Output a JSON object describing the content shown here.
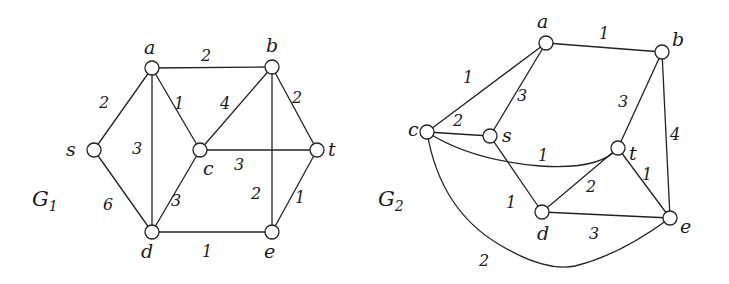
{
  "figure": {
    "graphs": [
      {
        "id": "G1",
        "title": "G",
        "subscript": "1",
        "title_pos": [
          32,
          206
        ],
        "nodes": [
          {
            "id": "a",
            "x": 152,
            "y": 68,
            "lx": 144,
            "ly": 54
          },
          {
            "id": "b",
            "x": 272,
            "y": 67,
            "lx": 266,
            "ly": 52
          },
          {
            "id": "s",
            "x": 94,
            "y": 150,
            "lx": 66,
            "ly": 156
          },
          {
            "id": "c",
            "x": 200,
            "y": 150,
            "lx": 203,
            "ly": 175
          },
          {
            "id": "t",
            "x": 317,
            "y": 150,
            "lx": 328,
            "ly": 156
          },
          {
            "id": "d",
            "x": 152,
            "y": 232,
            "lx": 141,
            "ly": 258
          },
          {
            "id": "e",
            "x": 272,
            "y": 232,
            "lx": 264,
            "ly": 258
          }
        ],
        "edges": [
          {
            "from": "a",
            "to": "b",
            "weight": "2",
            "wx": 206,
            "wy": 61
          },
          {
            "from": "s",
            "to": "a",
            "weight": "2",
            "wx": 104,
            "wy": 108
          },
          {
            "from": "a",
            "to": "c",
            "weight": "1",
            "wx": 179,
            "wy": 109
          },
          {
            "from": "a",
            "to": "d",
            "weight": "3",
            "wx": 137,
            "wy": 154
          },
          {
            "from": "c",
            "to": "b",
            "weight": "4",
            "wx": 225,
            "wy": 109
          },
          {
            "from": "b",
            "to": "t",
            "weight": "2",
            "wx": 297,
            "wy": 103
          },
          {
            "from": "b",
            "to": "e",
            "weight": "2",
            "wx": 256,
            "wy": 199
          },
          {
            "from": "c",
            "to": "t",
            "weight": "3",
            "wx": 239,
            "wy": 170
          },
          {
            "from": "s",
            "to": "d",
            "weight": "6",
            "wx": 108,
            "wy": 210
          },
          {
            "from": "c",
            "to": "d",
            "weight": "3",
            "wx": 176,
            "wy": 206
          },
          {
            "from": "t",
            "to": "e",
            "weight": "1",
            "wx": 300,
            "wy": 203
          },
          {
            "from": "d",
            "to": "e",
            "weight": "1",
            "wx": 207,
            "wy": 257
          }
        ]
      },
      {
        "id": "G2",
        "title": "G",
        "subscript": "2",
        "title_pos": [
          378,
          206
        ],
        "nodes": [
          {
            "id": "a",
            "x": 546,
            "y": 43,
            "lx": 537,
            "ly": 28
          },
          {
            "id": "b",
            "x": 662,
            "y": 52,
            "lx": 672,
            "ly": 46
          },
          {
            "id": "c",
            "x": 427,
            "y": 132,
            "lx": 408,
            "ly": 136
          },
          {
            "id": "s",
            "x": 490,
            "y": 136,
            "lx": 502,
            "ly": 142
          },
          {
            "id": "t",
            "x": 618,
            "y": 148,
            "lx": 629,
            "ly": 160
          },
          {
            "id": "d",
            "x": 542,
            "y": 212,
            "lx": 537,
            "ly": 240
          },
          {
            "id": "e",
            "x": 670,
            "y": 218,
            "lx": 680,
            "ly": 233
          }
        ],
        "edges": [
          {
            "from": "a",
            "to": "b",
            "weight": "1",
            "wx": 604,
            "wy": 39,
            "path": ""
          },
          {
            "from": "c",
            "to": "a",
            "weight": "1",
            "wx": 468,
            "wy": 83,
            "path": ""
          },
          {
            "from": "s",
            "to": "a",
            "weight": "3",
            "wx": 522,
            "wy": 101,
            "path": ""
          },
          {
            "from": "c",
            "to": "s",
            "weight": "2",
            "wx": 458,
            "wy": 126,
            "path": ""
          },
          {
            "from": "t",
            "to": "b",
            "weight": "3",
            "wx": 623,
            "wy": 107,
            "path": ""
          },
          {
            "from": "b",
            "to": "e",
            "weight": "4",
            "wx": 675,
            "wy": 140,
            "path": ""
          },
          {
            "from": "c",
            "to": "t",
            "weight": "1",
            "wx": 543,
            "wy": 161,
            "path": "M427,132 Q470,160 540,166 Q600,170 618,148"
          },
          {
            "from": "s",
            "to": "d",
            "weight": "1",
            "wx": 511,
            "wy": 208,
            "path": ""
          },
          {
            "from": "d",
            "to": "t",
            "weight": "2",
            "wx": 591,
            "wy": 192,
            "path": ""
          },
          {
            "from": "t",
            "to": "e",
            "weight": "1",
            "wx": 647,
            "wy": 180,
            "path": ""
          },
          {
            "from": "d",
            "to": "e",
            "weight": "3",
            "wx": 594,
            "wy": 239,
            "path": ""
          },
          {
            "from": "c",
            "to": "e",
            "weight": "2",
            "wx": 484,
            "wy": 266,
            "path": "M427,132 Q440,210 500,245 Q545,272 575,266 Q620,255 670,218"
          }
        ]
      }
    ]
  }
}
